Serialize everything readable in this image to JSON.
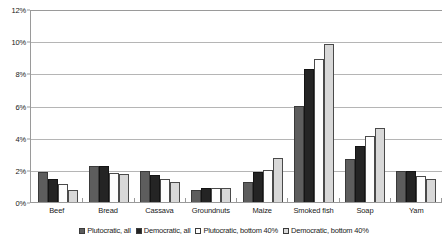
{
  "chart_data": {
    "type": "bar",
    "title": "",
    "xlabel": "",
    "ylabel": "",
    "ylim": [
      0,
      12
    ],
    "ytick_labels": [
      "0%",
      "2%",
      "4%",
      "6%",
      "8%",
      "10%",
      "12%"
    ],
    "ytick_values": [
      0,
      2,
      4,
      6,
      8,
      10,
      12
    ],
    "grid": true,
    "legend_position": "bottom",
    "categories": [
      "Beef",
      "Bread",
      "Cassava",
      "Groundnuts",
      "Maize",
      "Smoked fish",
      "Soap",
      "Yam"
    ],
    "series": [
      {
        "name": "Plutocratic, all",
        "color": "#5d5d5d",
        "values": [
          1.85,
          2.25,
          1.95,
          0.75,
          1.25,
          6.0,
          2.7,
          1.9
        ]
      },
      {
        "name": "Democratic, all",
        "color": "#242424",
        "values": [
          1.4,
          2.25,
          1.65,
          0.85,
          1.85,
          8.3,
          3.5,
          1.9
        ]
      },
      {
        "name": "Plutocratic, bottom 40%",
        "color": "#fdfdfd",
        "values": [
          1.1,
          1.8,
          1.45,
          0.9,
          2.0,
          8.9,
          4.1,
          1.6
        ]
      },
      {
        "name": "Democratic, bottom 40%",
        "color": "#d8d8d8",
        "values": [
          0.75,
          1.75,
          1.25,
          0.9,
          2.75,
          9.8,
          4.6,
          1.4
        ]
      }
    ]
  }
}
